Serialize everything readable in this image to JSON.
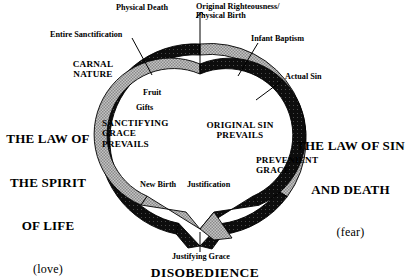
{
  "diagram": {
    "colors": {
      "dark": "#111111",
      "light": "#b9b9b9",
      "stroke": "#000000",
      "background": "#ffffff"
    },
    "outer_labels": [
      {
        "id": "physical-death",
        "text": "Physical Death"
      },
      {
        "id": "original-righteousness-physical-birth",
        "text": "Original Righteousness/\nPhysical Birth"
      },
      {
        "id": "entire-sanctification",
        "text": "Entire Sanctification"
      },
      {
        "id": "infant-baptism",
        "text": "Infant Baptism"
      },
      {
        "id": "actual-sin",
        "text": "Actual Sin"
      },
      {
        "id": "justifying-grace",
        "text": "Justifying Grace"
      }
    ],
    "ring_labels": [
      {
        "id": "carnal-nature",
        "text": "CARNAL\nNATURE"
      },
      {
        "id": "prevenient-grace",
        "text": "PREVENIENT\nGRACE"
      }
    ],
    "inner_labels": [
      {
        "id": "fruit",
        "text": "Fruit"
      },
      {
        "id": "gifts",
        "text": "Gifts"
      },
      {
        "id": "sanctifying-grace-prevails",
        "text": "SANCTIFYING\nGRACE\nPREVAILS"
      },
      {
        "id": "original-sin-prevails",
        "text": "ORIGINAL SIN\nPREVAILS"
      },
      {
        "id": "new-birth",
        "text": "New Birth"
      },
      {
        "id": "justification",
        "text": "Justification"
      }
    ],
    "side_labels": {
      "left": {
        "id": "law-of-the-spirit-of-life",
        "line1": "THE LAW OF",
        "line2": "THE SPIRIT",
        "line3": "OF LIFE",
        "line4": "(love)"
      },
      "right": {
        "id": "law-of-sin-and-death",
        "line1": "THE LAW OF SIN",
        "line2": "AND DEATH",
        "line3": "(fear)"
      }
    },
    "footer": {
      "id": "disobedience",
      "text": "DISOBEDIENCE"
    }
  }
}
